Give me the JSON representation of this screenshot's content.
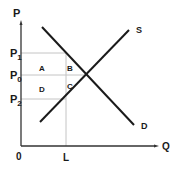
{
  "diagram": {
    "type": "supply-demand",
    "axes": {
      "y_label": "P",
      "x_label": "Q",
      "origin_label": "0"
    },
    "price_levels": [
      {
        "main": "P",
        "sub": "1"
      },
      {
        "main": "P",
        "sub": "0"
      },
      {
        "main": "P",
        "sub": "2"
      }
    ],
    "quantity_levels": [
      {
        "label": "L"
      }
    ],
    "curves": {
      "supply": "S",
      "demand": "D"
    },
    "regions": {
      "a": "A",
      "b": "B",
      "c": "C",
      "d": "D"
    },
    "colors": {
      "curve": "#1a1a1a",
      "axis": "#333333",
      "guide": "#bfbfbf"
    }
  }
}
